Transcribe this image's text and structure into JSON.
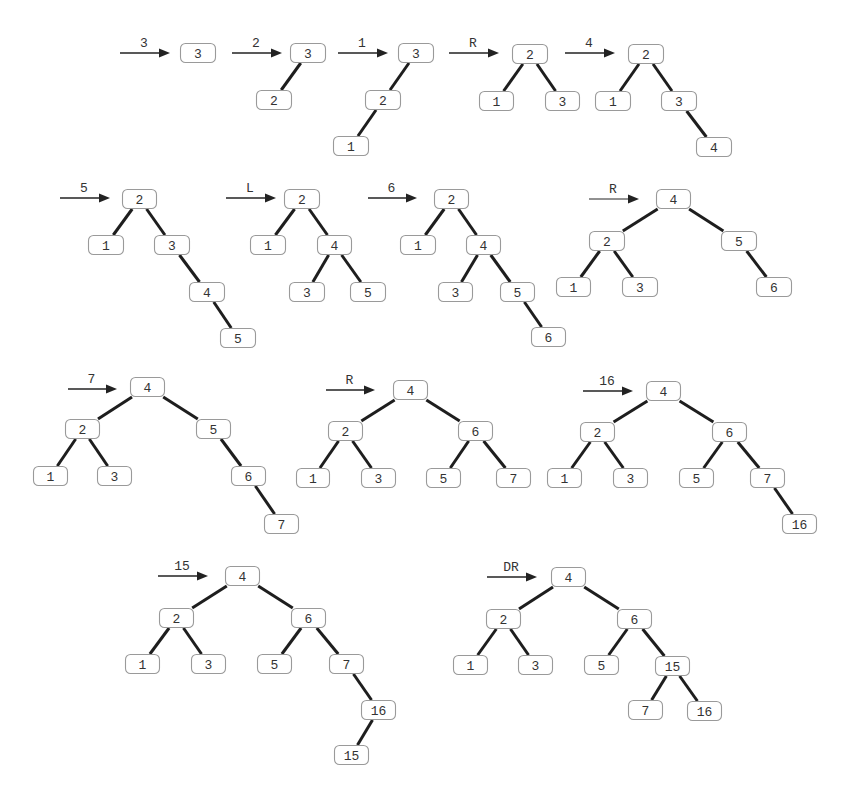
{
  "style": {
    "edge_color": "#1e1e1e",
    "box_border": "#9a9a9a",
    "text_color": "#333333",
    "box_w": 35,
    "box_h": 20
  },
  "steps": [
    {
      "id": "insert-3",
      "arrow": {
        "label": "3",
        "x1": 120,
        "x2": 170,
        "y": 53,
        "thin": false
      },
      "nodes": [
        {
          "k": "a",
          "label": "3",
          "x": 180,
          "y": 43,
          "w": 36
        }
      ],
      "edges": []
    },
    {
      "id": "insert-2",
      "arrow": {
        "label": "2",
        "x1": 232,
        "x2": 282,
        "y": 53,
        "thin": false
      },
      "nodes": [
        {
          "k": "a",
          "label": "3",
          "x": 290,
          "y": 43,
          "w": 36
        },
        {
          "k": "b",
          "label": "2",
          "x": 256,
          "y": 90,
          "w": 36
        }
      ],
      "edges": [
        [
          "a",
          "b"
        ]
      ]
    },
    {
      "id": "insert-1",
      "arrow": {
        "label": "1",
        "x1": 338,
        "x2": 388,
        "y": 53,
        "thin": false
      },
      "nodes": [
        {
          "k": "a",
          "label": "3",
          "x": 398,
          "y": 43,
          "w": 36
        },
        {
          "k": "b",
          "label": "2",
          "x": 365,
          "y": 90,
          "w": 36
        },
        {
          "k": "c",
          "label": "1",
          "x": 333,
          "y": 136,
          "w": 36
        }
      ],
      "edges": [
        [
          "a",
          "b"
        ],
        [
          "b",
          "c"
        ]
      ]
    },
    {
      "id": "rotate-R-1",
      "arrow": {
        "label": "R",
        "x1": 449,
        "x2": 499,
        "y": 53,
        "thin": false
      },
      "nodes": [
        {
          "k": "a",
          "label": "2",
          "x": 512,
          "y": 44,
          "w": 36
        },
        {
          "k": "b",
          "label": "1",
          "x": 479,
          "y": 91,
          "w": 35
        },
        {
          "k": "c",
          "label": "3",
          "x": 545,
          "y": 91,
          "w": 35
        }
      ],
      "edges": [
        [
          "a",
          "b"
        ],
        [
          "a",
          "c"
        ]
      ]
    },
    {
      "id": "insert-4",
      "arrow": {
        "label": "4",
        "x1": 565,
        "x2": 615,
        "y": 53,
        "thin": false
      },
      "nodes": [
        {
          "k": "a",
          "label": "2",
          "x": 628,
          "y": 44,
          "w": 36
        },
        {
          "k": "b",
          "label": "1",
          "x": 595,
          "y": 91,
          "w": 36
        },
        {
          "k": "c",
          "label": "3",
          "x": 661,
          "y": 91,
          "w": 36
        },
        {
          "k": "d",
          "label": "4",
          "x": 696,
          "y": 137,
          "w": 36
        }
      ],
      "edges": [
        [
          "a",
          "b"
        ],
        [
          "a",
          "c"
        ],
        [
          "c",
          "d"
        ]
      ]
    },
    {
      "id": "insert-5",
      "arrow": {
        "label": "5",
        "x1": 60,
        "x2": 110,
        "y": 198,
        "thin": false
      },
      "nodes": [
        {
          "k": "a",
          "label": "2",
          "x": 122,
          "y": 189,
          "w": 35
        },
        {
          "k": "b",
          "label": "1",
          "x": 88,
          "y": 235,
          "w": 36
        },
        {
          "k": "c",
          "label": "3",
          "x": 154,
          "y": 235,
          "w": 36
        },
        {
          "k": "d",
          "label": "4",
          "x": 189,
          "y": 282,
          "w": 36
        },
        {
          "k": "e",
          "label": "5",
          "x": 220,
          "y": 328,
          "w": 36
        }
      ],
      "edges": [
        [
          "a",
          "b"
        ],
        [
          "a",
          "c"
        ],
        [
          "c",
          "d"
        ],
        [
          "d",
          "e"
        ]
      ]
    },
    {
      "id": "rotate-L",
      "arrow": {
        "label": "L",
        "x1": 226,
        "x2": 276,
        "y": 198,
        "thin": false
      },
      "nodes": [
        {
          "k": "a",
          "label": "2",
          "x": 284,
          "y": 189,
          "w": 36
        },
        {
          "k": "b",
          "label": "1",
          "x": 250,
          "y": 235,
          "w": 36
        },
        {
          "k": "c",
          "label": "4",
          "x": 317,
          "y": 235,
          "w": 35
        },
        {
          "k": "d",
          "label": "3",
          "x": 289,
          "y": 282,
          "w": 36
        },
        {
          "k": "e",
          "label": "5",
          "x": 350,
          "y": 282,
          "w": 36
        }
      ],
      "edges": [
        [
          "a",
          "b"
        ],
        [
          "a",
          "c"
        ],
        [
          "c",
          "d"
        ],
        [
          "c",
          "e"
        ]
      ]
    },
    {
      "id": "insert-6",
      "arrow": {
        "label": "6",
        "x1": 368,
        "x2": 417,
        "y": 198,
        "thin": false
      },
      "nodes": [
        {
          "k": "a",
          "label": "2",
          "x": 434,
          "y": 189,
          "w": 35
        },
        {
          "k": "b",
          "label": "1",
          "x": 400,
          "y": 235,
          "w": 36
        },
        {
          "k": "c",
          "label": "4",
          "x": 466,
          "y": 235,
          "w": 35
        },
        {
          "k": "d",
          "label": "3",
          "x": 438,
          "y": 282,
          "w": 35
        },
        {
          "k": "e",
          "label": "5",
          "x": 500,
          "y": 282,
          "w": 35
        },
        {
          "k": "f",
          "label": "6",
          "x": 531,
          "y": 327,
          "w": 35
        }
      ],
      "edges": [
        [
          "a",
          "b"
        ],
        [
          "a",
          "c"
        ],
        [
          "c",
          "d"
        ],
        [
          "c",
          "e"
        ],
        [
          "e",
          "f"
        ]
      ]
    },
    {
      "id": "rotate-R-2",
      "arrow": {
        "label": "R",
        "x1": 589,
        "x2": 639,
        "y": 199,
        "thin": true
      },
      "nodes": [
        {
          "k": "a",
          "label": "4",
          "x": 656,
          "y": 189,
          "w": 35
        },
        {
          "k": "b",
          "label": "2",
          "x": 589,
          "y": 231,
          "w": 36
        },
        {
          "k": "c",
          "label": "5",
          "x": 721,
          "y": 231,
          "w": 36
        },
        {
          "k": "d",
          "label": "1",
          "x": 556,
          "y": 277,
          "w": 35
        },
        {
          "k": "e",
          "label": "3",
          "x": 622,
          "y": 277,
          "w": 36
        },
        {
          "k": "f",
          "label": "6",
          "x": 756,
          "y": 277,
          "w": 36
        }
      ],
      "edges": [
        [
          "a",
          "b"
        ],
        [
          "a",
          "c"
        ],
        [
          "b",
          "d"
        ],
        [
          "b",
          "e"
        ],
        [
          "c",
          "f"
        ]
      ]
    },
    {
      "id": "insert-7",
      "arrow": {
        "label": "7",
        "x1": 68,
        "x2": 117,
        "y": 389,
        "thin": false
      },
      "nodes": [
        {
          "k": "a",
          "label": "4",
          "x": 130,
          "y": 377,
          "w": 35
        },
        {
          "k": "b",
          "label": "2",
          "x": 65,
          "y": 419,
          "w": 35
        },
        {
          "k": "c",
          "label": "5",
          "x": 196,
          "y": 419,
          "w": 35
        },
        {
          "k": "d",
          "label": "1",
          "x": 33,
          "y": 466,
          "w": 35
        },
        {
          "k": "e",
          "label": "3",
          "x": 97,
          "y": 466,
          "w": 35
        },
        {
          "k": "f",
          "label": "6",
          "x": 231,
          "y": 466,
          "w": 35
        },
        {
          "k": "g",
          "label": "7",
          "x": 264,
          "y": 514,
          "w": 35
        }
      ],
      "edges": [
        [
          "a",
          "b"
        ],
        [
          "a",
          "c"
        ],
        [
          "b",
          "d"
        ],
        [
          "b",
          "e"
        ],
        [
          "c",
          "f"
        ],
        [
          "f",
          "g"
        ]
      ]
    },
    {
      "id": "rotate-R-3",
      "arrow": {
        "label": "R",
        "x1": 326,
        "x2": 375,
        "y": 390,
        "thin": false
      },
      "nodes": [
        {
          "k": "a",
          "label": "4",
          "x": 393,
          "y": 380,
          "w": 35
        },
        {
          "k": "b",
          "label": "2",
          "x": 328,
          "y": 421,
          "w": 35
        },
        {
          "k": "c",
          "label": "6",
          "x": 458,
          "y": 421,
          "w": 35
        },
        {
          "k": "d",
          "label": "1",
          "x": 296,
          "y": 468,
          "w": 34
        },
        {
          "k": "e",
          "label": "3",
          "x": 361,
          "y": 468,
          "w": 35
        },
        {
          "k": "f",
          "label": "5",
          "x": 426,
          "y": 468,
          "w": 35
        },
        {
          "k": "g",
          "label": "7",
          "x": 496,
          "y": 468,
          "w": 35
        }
      ],
      "edges": [
        [
          "a",
          "b"
        ],
        [
          "a",
          "c"
        ],
        [
          "b",
          "d"
        ],
        [
          "b",
          "e"
        ],
        [
          "c",
          "f"
        ],
        [
          "c",
          "g"
        ]
      ]
    },
    {
      "id": "insert-16",
      "arrow": {
        "label": "16",
        "x1": 583,
        "x2": 633,
        "y": 391,
        "thin": false
      },
      "nodes": [
        {
          "k": "a",
          "label": "4",
          "x": 646,
          "y": 381,
          "w": 35
        },
        {
          "k": "b",
          "label": "2",
          "x": 580,
          "y": 422,
          "w": 35
        },
        {
          "k": "c",
          "label": "6",
          "x": 712,
          "y": 422,
          "w": 35
        },
        {
          "k": "d",
          "label": "1",
          "x": 547,
          "y": 468,
          "w": 35
        },
        {
          "k": "e",
          "label": "3",
          "x": 613,
          "y": 468,
          "w": 35
        },
        {
          "k": "f",
          "label": "5",
          "x": 679,
          "y": 468,
          "w": 35
        },
        {
          "k": "g",
          "label": "7",
          "x": 750,
          "y": 468,
          "w": 35
        },
        {
          "k": "h",
          "label": "16",
          "x": 782,
          "y": 514,
          "w": 35
        }
      ],
      "edges": [
        [
          "a",
          "b"
        ],
        [
          "a",
          "c"
        ],
        [
          "b",
          "d"
        ],
        [
          "b",
          "e"
        ],
        [
          "c",
          "f"
        ],
        [
          "c",
          "g"
        ],
        [
          "g",
          "h"
        ]
      ]
    },
    {
      "id": "insert-15",
      "arrow": {
        "label": "15",
        "x1": 158,
        "x2": 208,
        "y": 576,
        "thin": false
      },
      "nodes": [
        {
          "k": "a",
          "label": "4",
          "x": 225,
          "y": 566,
          "w": 35
        },
        {
          "k": "b",
          "label": "2",
          "x": 159,
          "y": 608,
          "w": 35
        },
        {
          "k": "c",
          "label": "6",
          "x": 291,
          "y": 608,
          "w": 35
        },
        {
          "k": "d",
          "label": "1",
          "x": 125,
          "y": 654,
          "w": 35
        },
        {
          "k": "e",
          "label": "3",
          "x": 191,
          "y": 654,
          "w": 35
        },
        {
          "k": "f",
          "label": "5",
          "x": 257,
          "y": 654,
          "w": 35
        },
        {
          "k": "g",
          "label": "7",
          "x": 329,
          "y": 654,
          "w": 35
        },
        {
          "k": "h",
          "label": "16",
          "x": 361,
          "y": 700,
          "w": 35
        },
        {
          "k": "i",
          "label": "15",
          "x": 334,
          "y": 745,
          "w": 35
        }
      ],
      "edges": [
        [
          "a",
          "b"
        ],
        [
          "a",
          "c"
        ],
        [
          "b",
          "d"
        ],
        [
          "b",
          "e"
        ],
        [
          "c",
          "f"
        ],
        [
          "c",
          "g"
        ],
        [
          "g",
          "h"
        ],
        [
          "h",
          "i"
        ]
      ]
    },
    {
      "id": "rotate-DR",
      "arrow": {
        "label": "DR",
        "x1": 487,
        "x2": 537,
        "y": 577,
        "thin": false
      },
      "nodes": [
        {
          "k": "a",
          "label": "4",
          "x": 551,
          "y": 567,
          "w": 35
        },
        {
          "k": "b",
          "label": "2",
          "x": 486,
          "y": 609,
          "w": 35
        },
        {
          "k": "c",
          "label": "6",
          "x": 617,
          "y": 609,
          "w": 35
        },
        {
          "k": "d",
          "label": "1",
          "x": 453,
          "y": 655,
          "w": 35
        },
        {
          "k": "e",
          "label": "3",
          "x": 518,
          "y": 655,
          "w": 35
        },
        {
          "k": "f",
          "label": "5",
          "x": 584,
          "y": 655,
          "w": 35
        },
        {
          "k": "g",
          "label": "15",
          "x": 655,
          "y": 656,
          "w": 35
        },
        {
          "k": "h",
          "label": "7",
          "x": 628,
          "y": 700,
          "w": 35
        },
        {
          "k": "i",
          "label": "16",
          "x": 687,
          "y": 701,
          "w": 35
        }
      ],
      "edges": [
        [
          "a",
          "b"
        ],
        [
          "a",
          "c"
        ],
        [
          "b",
          "d"
        ],
        [
          "b",
          "e"
        ],
        [
          "c",
          "f"
        ],
        [
          "c",
          "g"
        ],
        [
          "g",
          "h"
        ],
        [
          "g",
          "i"
        ]
      ]
    }
  ]
}
